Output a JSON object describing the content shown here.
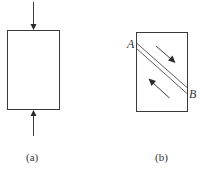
{
  "figure": {
    "panels": [
      {
        "id": "a",
        "caption": "(a)",
        "description": "Rectangular block under axial compression: one arrow pushes down on the top face, one arrow pushes up on the bottom face"
      },
      {
        "id": "b",
        "caption": "(b)",
        "description": "Rectangular block with a diagonal shear band (two parallel lines) from A to B; arrows on either side point in opposite directions along the band",
        "point_labels": [
          "A",
          "B"
        ]
      }
    ]
  }
}
